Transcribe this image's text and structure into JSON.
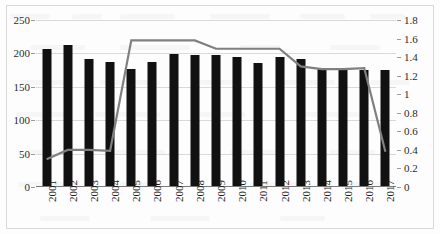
{
  "chart_data": {
    "type": "bar",
    "title": "",
    "subtitle": "",
    "xlabel": "",
    "ylabel": "",
    "categories": [
      "2001",
      "2002",
      "2003",
      "2004",
      "2005",
      "2006",
      "2007",
      "2008",
      "2009",
      "2010",
      "2011",
      "2012",
      "2013",
      "2014",
      "2015",
      "2016",
      "2017"
    ],
    "series": [
      {
        "name": "bars",
        "type": "bar",
        "axis": "left",
        "color": "#111111",
        "values": [
          206,
          212,
          192,
          187,
          176,
          187,
          199,
          197,
          198,
          195,
          186,
          195,
          192,
          176,
          176,
          175,
          175
        ]
      },
      {
        "name": "line",
        "type": "line",
        "axis": "right",
        "color": "#808080",
        "values": [
          0.3,
          0.4,
          0.4,
          0.39,
          1.58,
          1.58,
          1.58,
          1.58,
          1.49,
          1.49,
          1.49,
          1.49,
          1.3,
          1.27,
          1.27,
          1.28,
          0.38
        ]
      }
    ],
    "y_left": {
      "ticks": [
        0,
        50,
        100,
        150,
        200,
        250
      ],
      "tick_labels": [
        "0",
        "50",
        "100",
        "150",
        "200",
        "250"
      ],
      "ylim": [
        0,
        250
      ]
    },
    "y_right": {
      "ticks": [
        0,
        0.2,
        0.4,
        0.6,
        0.8,
        1,
        1.2,
        1.4,
        1.6,
        1.8
      ],
      "tick_labels": [
        "0",
        "0.2",
        "0.4",
        "0.6",
        "0.8",
        "1",
        "1.2",
        "1.4",
        "1.6",
        "1.8"
      ],
      "ylim": [
        0,
        1.8
      ]
    },
    "grid": true,
    "legend": null,
    "legend_position": "none"
  }
}
